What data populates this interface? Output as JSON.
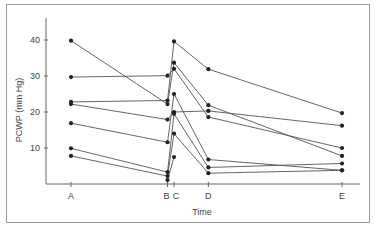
{
  "chart_data": {
    "type": "line",
    "title": "",
    "xlabel": "Time",
    "ylabel": "PCWP (mm Hg)",
    "x": [
      "A",
      "B",
      "C",
      "D",
      "E"
    ],
    "x_positions": [
      0,
      5.2,
      5.55,
      7.4,
      14.6
    ],
    "ylim": [
      0,
      46
    ],
    "yticks": [
      10,
      20,
      30,
      40
    ],
    "grid": false,
    "legend": "none",
    "series": [
      {
        "name": "patient-1",
        "values": [
          39.8,
          22.2,
          33.7,
          21.9,
          7.8
        ]
      },
      {
        "name": "patient-2",
        "values": [
          29.7,
          30.1,
          32.0,
          18.6,
          10.0
        ]
      },
      {
        "name": "patient-3",
        "values": [
          22.8,
          23.2,
          39.6,
          31.9,
          19.7
        ]
      },
      {
        "name": "patient-4",
        "values": [
          22.2,
          17.9,
          20.0,
          20.3,
          16.2
        ]
      },
      {
        "name": "patient-5",
        "values": [
          16.9,
          11.6,
          25.0,
          6.8,
          3.8
        ]
      },
      {
        "name": "patient-6",
        "values": [
          9.9,
          3.3,
          19.5,
          4.6,
          5.7
        ]
      },
      {
        "name": "patient-7",
        "values": [
          7.8,
          2.2,
          14.0,
          3.0,
          3.8
        ]
      },
      {
        "name": "patient-8",
        "values": [
          null,
          1.1,
          7.5,
          null,
          null
        ]
      }
    ]
  }
}
